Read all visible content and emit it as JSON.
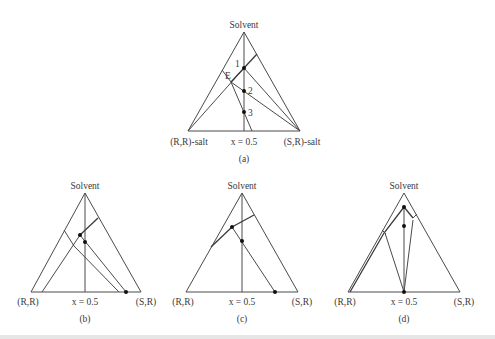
{
  "figure": {
    "panels": [
      {
        "id": "a",
        "caption": "(a)",
        "apex_label": "Solvent",
        "left_label": "(R,R)-salt",
        "right_label": "(S,R)-salt",
        "mid_label": "x = 0.5",
        "point_labels": [
          "1",
          "2",
          "3"
        ],
        "eutectic_label": "E"
      },
      {
        "id": "b",
        "caption": "(b)",
        "apex_label": "Solvent",
        "left_label": "(R,R)",
        "right_label": "(S,R)",
        "mid_label": "x = 0.5"
      },
      {
        "id": "c",
        "caption": "(c)",
        "apex_label": "Solvent",
        "left_label": "(R,R)",
        "right_label": "(S,R)",
        "mid_label": "x = 0.5"
      },
      {
        "id": "d",
        "caption": "(d)",
        "apex_label": "Solvent",
        "left_label": "(R,R)",
        "right_label": "(S,R)",
        "mid_label": "x = 0.5"
      }
    ],
    "colors": {
      "line": "#4a4a4a",
      "text": "#3a3a3a",
      "point": "#111111",
      "background": "#ffffff"
    }
  }
}
